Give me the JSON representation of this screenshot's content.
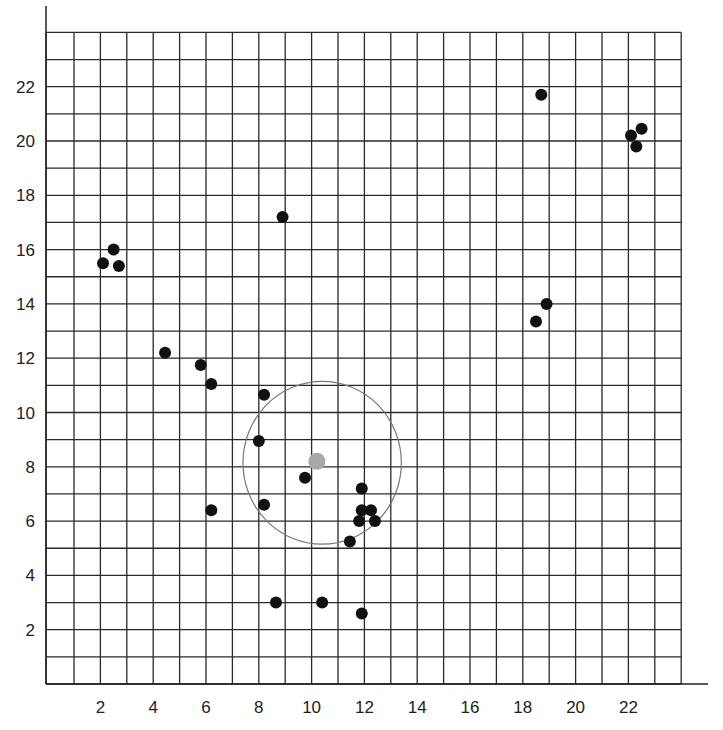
{
  "chart_data": {
    "type": "scatter",
    "title": "",
    "xlabel": "",
    "ylabel": "",
    "xlim": [
      0,
      24
    ],
    "ylim": [
      0,
      24
    ],
    "grid": true,
    "grid_step": 1,
    "x_ticks": [
      2,
      4,
      6,
      8,
      10,
      12,
      14,
      16,
      18,
      20,
      22
    ],
    "y_ticks": [
      2,
      4,
      6,
      8,
      10,
      12,
      14,
      16,
      18,
      20,
      22
    ],
    "x_tick_labels": [
      "2",
      "4",
      "6",
      "8",
      "10",
      "12",
      "14",
      "16",
      "18",
      "20",
      "22"
    ],
    "y_tick_labels": [
      "2",
      "4",
      "6",
      "8",
      "10",
      "12",
      "14",
      "16",
      "18",
      "20",
      "22"
    ],
    "series": [
      {
        "name": "points",
        "color": "#111111",
        "points": [
          {
            "x": 2.1,
            "y": 15.5
          },
          {
            "x": 2.5,
            "y": 16.0
          },
          {
            "x": 2.7,
            "y": 15.4
          },
          {
            "x": 8.9,
            "y": 17.2
          },
          {
            "x": 4.45,
            "y": 12.2
          },
          {
            "x": 5.8,
            "y": 11.75
          },
          {
            "x": 6.2,
            "y": 11.05
          },
          {
            "x": 8.2,
            "y": 10.65
          },
          {
            "x": 8.0,
            "y": 8.95
          },
          {
            "x": 9.75,
            "y": 7.6
          },
          {
            "x": 8.2,
            "y": 6.6
          },
          {
            "x": 6.2,
            "y": 6.4
          },
          {
            "x": 11.9,
            "y": 7.2
          },
          {
            "x": 11.9,
            "y": 6.4
          },
          {
            "x": 12.25,
            "y": 6.4
          },
          {
            "x": 11.8,
            "y": 6.0
          },
          {
            "x": 12.4,
            "y": 6.0
          },
          {
            "x": 11.45,
            "y": 5.25
          },
          {
            "x": 8.65,
            "y": 3.0
          },
          {
            "x": 10.4,
            "y": 3.0
          },
          {
            "x": 11.9,
            "y": 2.6
          },
          {
            "x": 18.7,
            "y": 21.7
          },
          {
            "x": 22.1,
            "y": 20.2
          },
          {
            "x": 22.5,
            "y": 20.45
          },
          {
            "x": 22.3,
            "y": 19.8
          },
          {
            "x": 18.9,
            "y": 14.0
          },
          {
            "x": 18.5,
            "y": 13.35
          }
        ]
      },
      {
        "name": "centroid",
        "color": "#a8a8a8",
        "points": [
          {
            "x": 10.2,
            "y": 8.2
          }
        ]
      }
    ],
    "annotations": [
      {
        "type": "circle",
        "center": {
          "x": 10.4,
          "y": 8.15
        },
        "radius": 3.0,
        "color": "#777777"
      }
    ]
  }
}
